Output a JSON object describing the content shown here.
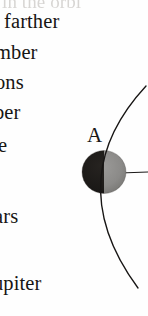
{
  "page": {
    "background_color": "#fefefe",
    "ink_color": "#171514"
  },
  "text_column": {
    "lines": [
      {
        "id": "clipped-top",
        "text": "in the orbi",
        "cropped": true,
        "faint": true
      },
      {
        "id": "line-1",
        "text": "farther"
      },
      {
        "id": "line-2",
        "text": "mber"
      },
      {
        "id": "line-3",
        "text": "ons"
      },
      {
        "id": "line-4",
        "text": "ber"
      },
      {
        "id": "line-5",
        "text": "e"
      },
      {
        "id": "line-6",
        "text": "ars"
      },
      {
        "id": "line-7",
        "text": "upiter"
      }
    ]
  },
  "diagram": {
    "label": "A",
    "body": {
      "name": "half-illuminated-body",
      "dark_side_color": "#1c1a18",
      "lit_side_color": "#8d8c8a",
      "outline_color": "#2a2725"
    },
    "orbit_arc": {
      "name": "orbit-arc",
      "color": "#171514",
      "stroke_width": 1.3
    },
    "radius_line": {
      "name": "radius-tick",
      "color": "#1b1918"
    }
  }
}
